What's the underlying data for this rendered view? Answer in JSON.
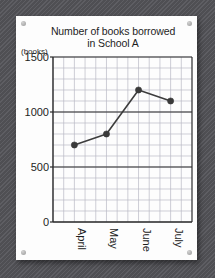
{
  "card": {
    "title_line1": "Number of books borrowed",
    "title_line2": "in School A",
    "unit_label": "(books)"
  },
  "chart_data": {
    "type": "line",
    "title": "Number of books borrowed in School A",
    "xlabel": "",
    "ylabel": "(books)",
    "categories": [
      "April",
      "May",
      "June",
      "July"
    ],
    "values": [
      700,
      800,
      1200,
      1100
    ],
    "series": [
      {
        "name": "School A",
        "values": [
          700,
          800,
          1200,
          1100
        ]
      }
    ],
    "ylim": [
      0,
      1500
    ],
    "yticks": [
      0,
      500,
      1000,
      1500
    ],
    "ytick_labels": [
      "0",
      "500",
      "1000",
      "1500"
    ],
    "minor_gridline_step": 100,
    "grid": true,
    "legend": false,
    "marker": "filled-circle",
    "line_color": "#3d3d3d",
    "marker_color": "#3a3a3a",
    "grid_color": "#b9b9c4",
    "axis_color": "#2b2b2b"
  }
}
